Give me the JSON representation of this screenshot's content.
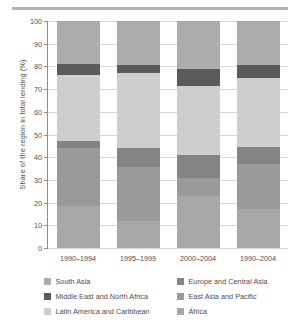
{
  "figure": {
    "divider_name": "top-rule"
  },
  "chart_data": {
    "type": "bar",
    "stacked": true,
    "title": "",
    "xlabel": "",
    "ylabel": "Share of the region in total lending (%)",
    "ylim": [
      0,
      100
    ],
    "ytick_step": 10,
    "yticks": [
      "100",
      "90",
      "80",
      "70",
      "60",
      "50",
      "40",
      "30",
      "20",
      "10",
      "0"
    ],
    "grid": true,
    "grid_axis": "y",
    "legend_position": "bottom",
    "legend_columns": 2,
    "categories": [
      "1990–1994",
      "1995–1999",
      "2000–2004",
      "1990–2004"
    ],
    "stack_order_bottom_to_top": [
      "África",
      "East Asia and Pacific",
      "Europe and Central Asia",
      "Latin America and Caribbean",
      "Middle East and North Africa",
      "South Asia"
    ],
    "series": [
      {
        "name": "África",
        "color": "#a8a8a8",
        "values": [
          18.5,
          12.0,
          23.0,
          17.0
        ]
      },
      {
        "name": "East Asia and Pacific",
        "color": "#9a9a9a",
        "values": [
          25.5,
          23.5,
          8.0,
          20.0
        ]
      },
      {
        "name": "Europe and Central Asia",
        "color": "#848484",
        "values": [
          3.0,
          8.5,
          10.0,
          7.5
        ]
      },
      {
        "name": "Latin America and Caribbean",
        "color": "#cecece",
        "values": [
          29.0,
          33.0,
          30.5,
          30.5
        ]
      },
      {
        "name": "Middle East and North Africa",
        "color": "#5a5a5a",
        "values": [
          5.0,
          3.5,
          7.5,
          5.5
        ]
      },
      {
        "name": "South Asia",
        "color": "#acacac",
        "values": [
          19.0,
          19.5,
          21.0,
          19.5
        ]
      }
    ]
  },
  "legend": {
    "column_left": [
      {
        "label": "South Asia",
        "color": "#acacac"
      },
      {
        "label": "Middle East and North Africa",
        "color": "#5a5a5a"
      },
      {
        "label": "Latin America and Caribbean",
        "color": "#cecece"
      }
    ],
    "column_right": [
      {
        "label": "Europe and Central Asia",
        "color": "#848484"
      },
      {
        "label": "East Asia and Pacific",
        "color": "#9a9a9a"
      },
      {
        "label": "África",
        "color": "#a8a8a8"
      }
    ]
  }
}
